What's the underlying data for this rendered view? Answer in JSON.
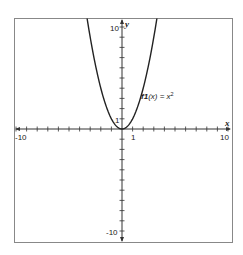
{
  "chart_data": {
    "type": "line",
    "title": "",
    "xlabel": "x",
    "ylabel": "y",
    "xlim": [
      -10,
      10
    ],
    "ylim": [
      -10,
      10
    ],
    "grid": false,
    "x_tick_labels": [
      "-10",
      "1",
      "10"
    ],
    "y_tick_labels": [
      "10",
      "1",
      "-10"
    ],
    "series": [
      {
        "name": "f1(x) = x^2",
        "label_text": "f1(x) = x",
        "label_superscript": "2",
        "x": [
          -3.2,
          -3,
          -2.5,
          -2,
          -1.5,
          -1,
          -0.5,
          0,
          0.5,
          1,
          1.5,
          2,
          2.5,
          3,
          3.2
        ],
        "y": [
          10.24,
          9,
          6.25,
          4,
          2.25,
          1,
          0.25,
          0,
          0.25,
          1,
          2.25,
          4,
          6.25,
          9,
          10.24
        ]
      }
    ]
  },
  "labels": {
    "x_axis": "x",
    "y_axis": "y",
    "x_min": "-10",
    "x_one": "1",
    "x_max": "10",
    "y_max": "10",
    "y_one": "1",
    "y_min": "-10",
    "function_name": "f1",
    "function_arg": "(x) = x",
    "function_exp": "2"
  },
  "colors": {
    "frame": "#888888",
    "axis": "#333333",
    "curve": "#222222",
    "background": "#ffffff"
  }
}
